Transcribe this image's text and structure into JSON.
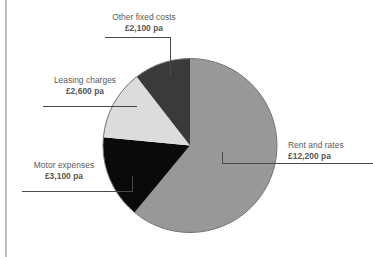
{
  "chart_data": {
    "type": "pie",
    "title": "",
    "subtitle": "",
    "xlabel": "",
    "ylabel": "",
    "legend_position": "none",
    "grid": false,
    "currency": "£",
    "unit_suffix": "pa",
    "total": 20000,
    "categories": [
      "Rent and rates",
      "Motor expenses",
      "Leasing charges",
      "Other fixed costs"
    ],
    "values": [
      12200,
      3100,
      2600,
      2100
    ],
    "value_labels": [
      "£12,200 pa",
      "£3,100 pa",
      "£2,600 pa",
      "£2,100 pa"
    ],
    "colors": [
      "#989898",
      "#0a0a0a",
      "#dcdcdc",
      "#3a3a3a"
    ],
    "slices": [
      {
        "name": "Rent and rates",
        "value": 12200,
        "value_label": "£12,200 pa",
        "color": "#989898",
        "start_angle_deg": 0,
        "end_angle_deg": 219.6,
        "percent": 61
      },
      {
        "name": "Motor expenses",
        "value": 3100,
        "value_label": "£3,100 pa",
        "color": "#0a0a0a",
        "start_angle_deg": 219.6,
        "end_angle_deg": 275.4,
        "percent": 15.5
      },
      {
        "name": "Leasing charges",
        "value": 2600,
        "value_label": "£2,600 pa",
        "color": "#dcdcdc",
        "start_angle_deg": 275.4,
        "end_angle_deg": 322.2,
        "percent": 13
      },
      {
        "name": "Other fixed costs",
        "value": 2100,
        "value_label": "£2,100 pa",
        "color": "#3a3a3a",
        "start_angle_deg": 322.2,
        "end_angle_deg": 360,
        "percent": 10.5
      }
    ]
  },
  "labels": {
    "other_fixed_costs": {
      "name": "Other fixed costs",
      "value": "£2,100 pa"
    },
    "leasing_charges": {
      "name": "Leasing charges",
      "value": "£2,600 pa"
    },
    "motor_expenses": {
      "name": "Motor expenses",
      "value": "£3,100 pa"
    },
    "rent_and_rates": {
      "name": "Rent and rates",
      "value": "£12,200 pa"
    }
  },
  "style": {
    "background": "#ffffff",
    "label_text_color": "#5a5a5a",
    "leader_line_color": "#4a4a4a",
    "pie_outline_color": "#6e6e6e",
    "frame_rule_color": "#b5b5b5"
  }
}
